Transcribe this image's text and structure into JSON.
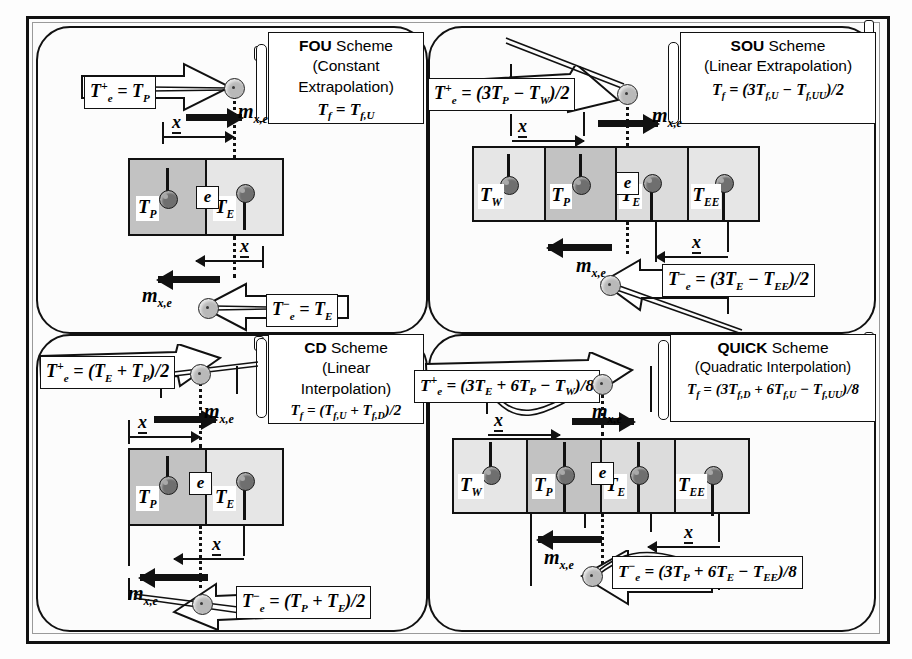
{
  "figure": {
    "panel_count": 4
  },
  "colors": {
    "ink": "#111111",
    "cell_light": "#e6e6e6",
    "cell_mid": "#dcdcdc",
    "cell_dark": "#c2c2c2",
    "node_fill": "#6f6f6f",
    "ball_fill": "#b9b9b9",
    "page": "#fdfdfd"
  },
  "panels": [
    {
      "id": "fou",
      "title": {
        "scheme_name": "FOU",
        "scheme_word": "Scheme",
        "subtitle_line1": "(Constant",
        "subtitle_line2": "Extrapolation)",
        "tf_formula": "Tƒ = Tƒ,U"
      },
      "cells": [
        {
          "label": "T",
          "sub": "P",
          "shade": "dark"
        },
        {
          "label": "T",
          "sub": "E",
          "shade": "light"
        }
      ],
      "face_marker": "e",
      "upper": {
        "formula_lhs": "T",
        "formula_sup": "+",
        "formula_sub": "e",
        "formula_rhs": "= T",
        "formula_rhs_sub": "P",
        "formula_text": "T₊ₑ = Tₚ",
        "flux_label": "m",
        "flux_sub": "x,e",
        "flux_direction": "right",
        "x_label": "x",
        "x_direction": "right"
      },
      "lower": {
        "formula_text": "T⁻ₑ = Tᴇ",
        "flux_label": "m",
        "flux_sub": "x,e",
        "flux_direction": "left",
        "x_label": "x",
        "x_direction": "left"
      }
    },
    {
      "id": "sou",
      "title": {
        "scheme_name": "SOU",
        "scheme_word": "Scheme",
        "subtitle_line1": "(Linear Extrapolation)",
        "subtitle_line2": "",
        "tf_formula": "Tƒ = (3Tƒ,U - Tƒ,UU)/2"
      },
      "cells": [
        {
          "label": "T",
          "sub": "W",
          "shade": "light"
        },
        {
          "label": "T",
          "sub": "P",
          "shade": "dark"
        },
        {
          "label": "T",
          "sub": "E",
          "shade": "mid"
        },
        {
          "label": "T",
          "sub": "EE",
          "shade": "light"
        }
      ],
      "face_marker": "e",
      "upper": {
        "formula_text": "T₊ₑ = (3Tₚ - Tᴡ)/2",
        "flux_label": "m",
        "flux_sub": "x,e",
        "flux_direction": "right",
        "x_label": "x",
        "x_direction": "right"
      },
      "lower": {
        "formula_text": "T⁻ₑ = (3Tᴇ - Tᴇᴇ)/2",
        "flux_label": "m",
        "flux_sub": "x,e",
        "flux_direction": "left",
        "x_label": "x",
        "x_direction": "left"
      }
    },
    {
      "id": "cd",
      "title": {
        "scheme_name": "CD",
        "scheme_word": "Scheme",
        "subtitle_line1": "(Linear",
        "subtitle_line2": "Interpolation)",
        "tf_formula": "Tƒ = (Tƒ,U + Tƒ,D)/2"
      },
      "cells": [
        {
          "label": "T",
          "sub": "P",
          "shade": "dark"
        },
        {
          "label": "T",
          "sub": "E",
          "shade": "light"
        }
      ],
      "face_marker": "e",
      "upper": {
        "formula_text": "T₊ₑ = (Tᴇ + Tₚ)/2",
        "flux_label": "m",
        "flux_sub": "x,e",
        "flux_direction": "right",
        "x_label": "x",
        "x_direction": "right"
      },
      "lower": {
        "formula_text": "T⁻ₑ = (Tₚ + Tᴇ)/2",
        "flux_label": "m",
        "flux_sub": "x,e",
        "flux_direction": "left",
        "x_label": "x",
        "x_direction": "left"
      }
    },
    {
      "id": "quick",
      "title": {
        "scheme_name": "QUICK",
        "scheme_word": "Scheme",
        "subtitle_line1": "(Quadratic Interpolation)",
        "subtitle_line2": "",
        "tf_formula": "Tƒ = (3Tƒ,D + 6Tƒ,U - Tƒ,UU)/8"
      },
      "cells": [
        {
          "label": "T",
          "sub": "W",
          "shade": "light"
        },
        {
          "label": "T",
          "sub": "P",
          "shade": "dark"
        },
        {
          "label": "T",
          "sub": "E",
          "shade": "mid"
        },
        {
          "label": "T",
          "sub": "EE",
          "shade": "light"
        }
      ],
      "face_marker": "e",
      "upper": {
        "formula_text": "T₊ₑ = (3Tᴇ + 6Tₚ - Tᴡ)/8",
        "flux_label": "m",
        "flux_sub": "x,e",
        "flux_direction": "right",
        "x_label": "x",
        "x_direction": "right"
      },
      "lower": {
        "formula_text": "T⁻ₑ = (3Tₚ + 6Tᴇ - Tᴇᴇ)/8",
        "flux_label": "m",
        "flux_sub": "x,e",
        "flux_direction": "left",
        "x_label": "x",
        "x_direction": "left"
      }
    }
  ],
  "text": {
    "scheme_word": "Scheme",
    "face_marker": "e",
    "x_label": "x",
    "flux_label": "m",
    "flux_sub": "x,e"
  }
}
